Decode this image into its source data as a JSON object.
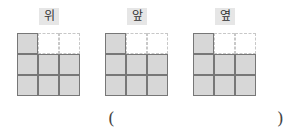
{
  "views": [
    {
      "label": "위",
      "cells": [
        [
          1,
          0,
          0
        ],
        [
          1,
          1,
          1
        ],
        [
          1,
          1,
          1
        ]
      ]
    },
    {
      "label": "앞",
      "cells": [
        [
          1,
          0,
          0
        ],
        [
          1,
          1,
          1
        ],
        [
          1,
          1,
          1
        ]
      ]
    },
    {
      "label": "옆",
      "cells": [
        [
          1,
          0,
          0
        ],
        [
          1,
          1,
          1
        ],
        [
          1,
          1,
          1
        ]
      ]
    }
  ],
  "answer": {
    "open": "(",
    "close": ")",
    "value": ""
  }
}
